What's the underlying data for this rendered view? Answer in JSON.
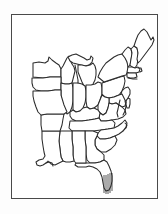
{
  "image": {
    "kind": "outline-map",
    "title": "Eastern United States Outline Map",
    "description": "Black and white line-art outline map of the eastern United States showing state boundaries, framed by a thin rectangular border.",
    "alt_text": "Map of the eastern United States with state outlines"
  },
  "frame": {
    "border_color": "#4a4a4a",
    "background_color": "#ffffff",
    "page_background_color": "#fdfdfd",
    "x": 11,
    "y": 14,
    "width": 147,
    "height": 185
  },
  "style": {
    "line_color": "#2b2b2b",
    "fill_color": "#ffffff",
    "line_width": "1.05"
  },
  "map": {
    "region": "Eastern United States",
    "projection_hint": "generalized",
    "viewbox": "0 0 145 183",
    "states": [
      {
        "name": "Minnesota",
        "abbr": "MN"
      },
      {
        "name": "Wisconsin",
        "abbr": "WI"
      },
      {
        "name": "Michigan",
        "abbr": "MI"
      },
      {
        "name": "Iowa",
        "abbr": "IA"
      },
      {
        "name": "Illinois",
        "abbr": "IL"
      },
      {
        "name": "Indiana",
        "abbr": "IN"
      },
      {
        "name": "Ohio",
        "abbr": "OH"
      },
      {
        "name": "Pennsylvania",
        "abbr": "PA"
      },
      {
        "name": "New York",
        "abbr": "NY"
      },
      {
        "name": "Vermont",
        "abbr": "VT"
      },
      {
        "name": "New Hampshire",
        "abbr": "NH"
      },
      {
        "name": "Maine",
        "abbr": "ME"
      },
      {
        "name": "Massachusetts",
        "abbr": "MA"
      },
      {
        "name": "Connecticut",
        "abbr": "CT"
      },
      {
        "name": "Rhode Island",
        "abbr": "RI"
      },
      {
        "name": "New Jersey",
        "abbr": "NJ"
      },
      {
        "name": "Delaware",
        "abbr": "DE"
      },
      {
        "name": "Maryland",
        "abbr": "MD"
      },
      {
        "name": "West Virginia",
        "abbr": "WV"
      },
      {
        "name": "Virginia",
        "abbr": "VA"
      },
      {
        "name": "Kentucky",
        "abbr": "KY"
      },
      {
        "name": "Tennessee",
        "abbr": "TN"
      },
      {
        "name": "North Carolina",
        "abbr": "NC"
      },
      {
        "name": "South Carolina",
        "abbr": "SC"
      },
      {
        "name": "Georgia",
        "abbr": "GA"
      },
      {
        "name": "Florida",
        "abbr": "FL"
      },
      {
        "name": "Alabama",
        "abbr": "AL"
      },
      {
        "name": "Mississippi",
        "abbr": "MS"
      },
      {
        "name": "Louisiana",
        "abbr": "LA"
      },
      {
        "name": "Arkansas",
        "abbr": "AR"
      },
      {
        "name": "Missouri",
        "abbr": "MO"
      }
    ],
    "outline_path": "M 36 58 L 33 52 L 31 46 L 33 42 L 37 40 L 41 42 L 45 44 L 50 45 L 54 43 L 57 40 L 60 37 L 63 39 L 66 43 L 70 46 L 73 45 L 74 41 L 77 38 L 80 35 L 84 33 L 88 31 L 92 29 L 97 27 L 102 24 L 106 21 L 110 19 L 114 16 L 118 14 L 121 13 L 124 15 L 127 19 L 130 23 L 133 26 L 136 24 L 138 21 L 140 19 L 141 22 L 140 27 L 138 32 L 135 37 L 132 42 L 129 46 L 126 50 L 123 53 L 121 57 L 120 62 L 118 67 L 117 72 L 116 77 L 115 82 L 114 87 L 113 92 L 112 97 L 110 102 L 108 107 L 106 112 L 104 117 L 102 122 L 100 127 L 98 132 L 96 137 L 93 141 L 90 145 L 88 150 L 87 155 L 86 160 L 85 165 L 83 169 L 80 171 L 77 169 L 75 165 L 73 160 L 71 155 L 68 151 L 64 148 L 60 147 L 56 148 L 52 150 L 48 152 L 44 153 L 40 152 L 36 150 L 32 148 L 28 147 L 25 145 L 23 141 L 22 136 L 21 131 L 20 126 L 19 121 L 18 116 L 17 111 L 16 106 L 16 101 L 17 96 L 18 91 L 19 86 L 20 81 L 21 76 L 22 71 L 24 66 L 27 62 L 31 60 Z",
    "internal_borders_count": 34,
    "features": [
      {
        "name": "Great Lakes",
        "type": "water-body"
      },
      {
        "name": "Lake Michigan",
        "type": "water-body"
      },
      {
        "name": "Chesapeake Bay",
        "type": "water-body"
      },
      {
        "name": "Florida Peninsula",
        "type": "landform"
      },
      {
        "name": "Mississippi River Delta",
        "type": "landform"
      },
      {
        "name": "Outer Banks",
        "type": "landform"
      },
      {
        "name": "Cape Cod",
        "type": "landform"
      },
      {
        "name": "Long Island",
        "type": "landform"
      }
    ]
  }
}
